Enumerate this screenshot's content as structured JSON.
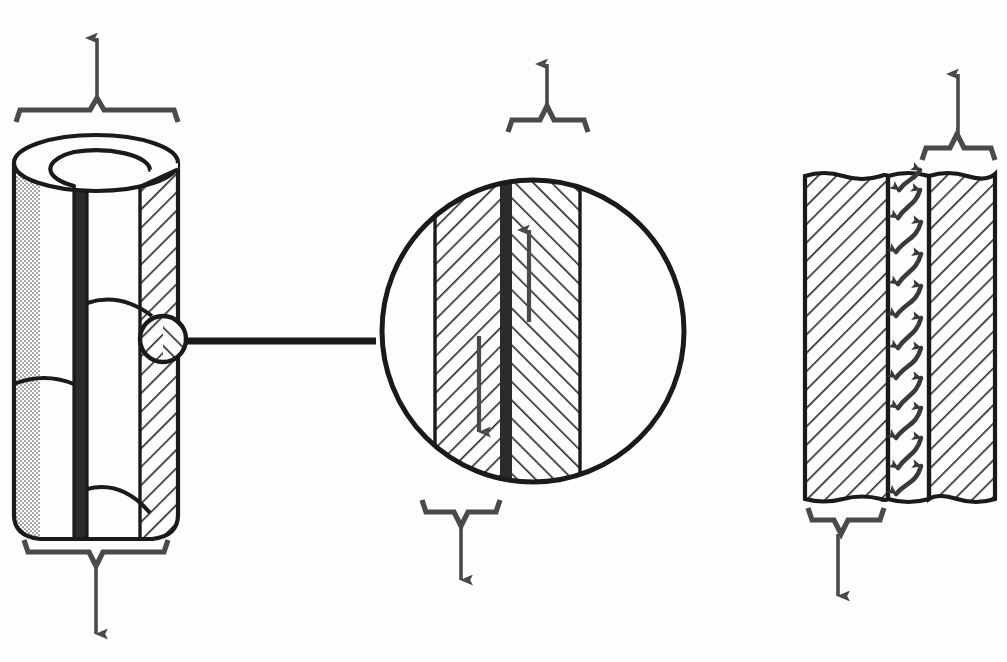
{
  "figure": {
    "domain": "diagram",
    "type": "technical-line-illustration",
    "background_color": "#fdfdfd",
    "ink_color": "#1a1a1a",
    "arrow_color": "#4a4a4a",
    "hatch_color": "#262626",
    "stipple_color": "#555555",
    "interface_band_color": "#2b2b2b",
    "panels": [
      {
        "id": "cylinder",
        "name": "cutaway-cylinder-panel",
        "label": ""
      },
      {
        "id": "detail",
        "name": "magnified-detail-panel",
        "label": ""
      },
      {
        "id": "flat",
        "name": "flat-interface-panel",
        "label": ""
      }
    ]
  },
  "cylinder_panel": {
    "name": "cutaway-cylinder",
    "geometry": {
      "left": 14,
      "right": 178,
      "top": 135,
      "bottom": 540,
      "ellipse_rx": 82,
      "ellipse_ry": 28,
      "inner_rx": 54,
      "inner_ry": 18
    },
    "regions": [
      {
        "name": "outer-wall-stipple",
        "fill": "stipple",
        "x": 16,
        "width": 22
      },
      {
        "name": "inner-surface",
        "fill": "white"
      },
      {
        "name": "cut-edge-dark-band",
        "fill": "solid-dark",
        "x": 74,
        "width": 14
      },
      {
        "name": "wall-cross-section-hatch",
        "fill": "hatch-right",
        "x": 140,
        "width": 34
      }
    ],
    "top_bracket": {
      "name": "tension-bracket-top",
      "x1": 16,
      "x2": 178,
      "y": 110,
      "peak_x": 97
    },
    "top_arrow": {
      "name": "tension-arrow-up",
      "x": 97,
      "y_tail": 104,
      "y_head": 30,
      "direction": "up"
    },
    "bottom_bracket": {
      "name": "tension-bracket-bottom",
      "x1": 24,
      "x2": 168,
      "y": 552,
      "peak_x": 96
    },
    "bottom_arrow": {
      "name": "tension-arrow-down",
      "x": 96,
      "y_tail": 568,
      "y_head": 640,
      "direction": "down"
    },
    "detail_circle": {
      "name": "detail-callout-circle",
      "cx": 163,
      "cy": 339,
      "r": 24
    }
  },
  "connector": {
    "name": "detail-leader-line",
    "x1": 187,
    "y1": 341,
    "x2": 373,
    "y2": 341,
    "thickness": 7
  },
  "detail_panel": {
    "name": "magnified-interface-circle",
    "circle": {
      "cx": 533,
      "cy": 331,
      "r": 153
    },
    "left_material": {
      "name": "material-a-region",
      "x": 435,
      "width": 65,
      "hatch": "down-right",
      "arrow": {
        "name": "shear-arrow-down",
        "x": 478,
        "y_tail": 338,
        "y_head": 430,
        "direction": "down"
      }
    },
    "interface": {
      "name": "interface-band",
      "x": 500,
      "width": 12,
      "color": "#2b2b2b"
    },
    "right_material": {
      "name": "material-b-region",
      "x": 512,
      "width": 68,
      "hatch": "up-right",
      "arrow": {
        "name": "shear-arrow-up",
        "x": 528,
        "y_tail": 320,
        "y_head": 228,
        "direction": "up"
      }
    },
    "top_bracket": {
      "name": "shear-bracket-top",
      "x1": 508,
      "x2": 588,
      "y": 118,
      "peak_x": 546
    },
    "top_arrow": {
      "name": "shear-load-arrow-up",
      "x": 547,
      "y_tail": 112,
      "y_head": 58,
      "direction": "up"
    },
    "bottom_bracket": {
      "name": "shear-bracket-bottom",
      "x1": 422,
      "x2": 500,
      "y": 512,
      "peak_x": 461
    },
    "bottom_arrow": {
      "name": "shear-load-arrow-down",
      "x": 461,
      "y_tail": 520,
      "y_head": 586,
      "direction": "down"
    }
  },
  "flat_panel": {
    "name": "flat-interface-entanglement",
    "bounds": {
      "left": 805,
      "right": 995,
      "top": 170,
      "bottom": 505
    },
    "left_block": {
      "name": "bulk-material-left",
      "x": 805,
      "width": 83,
      "hatch": "down-right"
    },
    "interphase": {
      "name": "interphase-entanglement-zone",
      "x": 888,
      "width": 41,
      "chain_count": 11,
      "chain_shape": "s-curve",
      "arrowheads": "both-ends"
    },
    "right_block": {
      "name": "bulk-material-right",
      "x": 929,
      "width": 66,
      "hatch": "down-right"
    },
    "top_edge": "torn-wavy",
    "bottom_edge": "torn-wavy",
    "top_bracket": {
      "name": "flat-bracket-top",
      "x1": 922,
      "x2": 995,
      "y": 148,
      "peak_x": 957
    },
    "top_arrow": {
      "name": "flat-load-arrow-up",
      "x": 959,
      "y_tail": 142,
      "y_head": 68,
      "direction": "up"
    },
    "bottom_bracket": {
      "name": "flat-bracket-bottom",
      "x1": 808,
      "x2": 884,
      "y": 520,
      "peak_x": 841
    },
    "bottom_arrow": {
      "name": "flat-load-arrow-down",
      "x": 837,
      "y_tail": 528,
      "y_head": 602,
      "direction": "down"
    }
  }
}
